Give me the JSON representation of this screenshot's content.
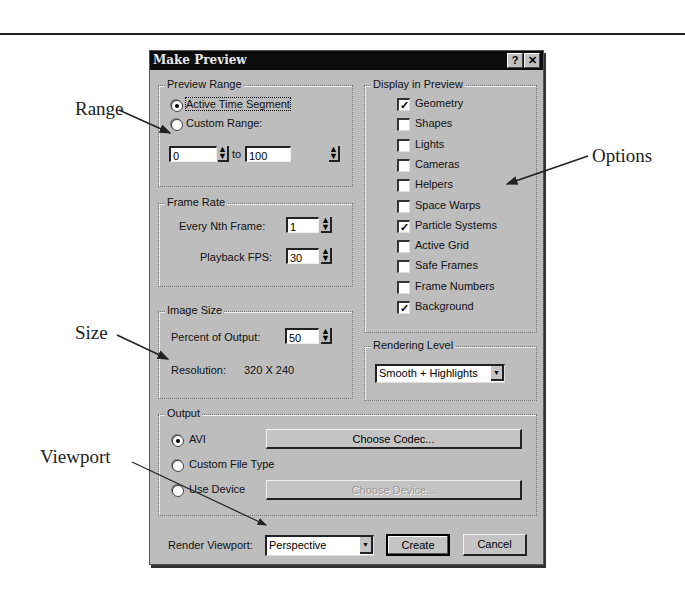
{
  "annotations": {
    "range": "Range",
    "options": "Options",
    "size": "Size",
    "viewport": "Viewport"
  },
  "dialog": {
    "title": "Make Preview",
    "help_button": "?",
    "close_button": "✕",
    "preview_range": {
      "label": "Preview Range",
      "active_time_segment": "Active Time Segment",
      "custom_range": "Custom Range:",
      "selected": "active_time_segment",
      "from_value": "0",
      "to_label": "to",
      "to_value": "100"
    },
    "frame_rate": {
      "label": "Frame Rate",
      "every_nth_label": "Every Nth Frame:",
      "every_nth_value": "1",
      "playback_fps_label": "Playback FPS:",
      "playback_fps_value": "30"
    },
    "image_size": {
      "label": "Image Size",
      "percent_label": "Percent of Output:",
      "percent_value": "50",
      "resolution_label": "Resolution:",
      "resolution_value": "320  X  240"
    },
    "display_in_preview": {
      "label": "Display in Preview",
      "items": [
        {
          "label": "Geometry",
          "checked": true
        },
        {
          "label": "Shapes",
          "checked": false
        },
        {
          "label": "Lights",
          "checked": false
        },
        {
          "label": "Cameras",
          "checked": false
        },
        {
          "label": "Helpers",
          "checked": false
        },
        {
          "label": "Space Warps",
          "checked": false
        },
        {
          "label": "Particle Systems",
          "checked": true
        },
        {
          "label": "Active Grid",
          "checked": false
        },
        {
          "label": "Safe Frames",
          "checked": false
        },
        {
          "label": "Frame Numbers",
          "checked": false
        },
        {
          "label": "Background",
          "checked": true
        }
      ]
    },
    "rendering_level": {
      "label": "Rendering Level",
      "value": "Smooth + Highlights"
    },
    "output": {
      "label": "Output",
      "avi": "AVI",
      "custom_file_type": "Custom File Type",
      "use_device": "Use Device",
      "selected": "avi",
      "choose_codec": "Choose Codec...",
      "choose_device": "Choose Device..."
    },
    "footer": {
      "render_viewport_label": "Render Viewport:",
      "render_viewport_value": "Perspective",
      "create": "Create",
      "cancel": "Cancel"
    }
  }
}
